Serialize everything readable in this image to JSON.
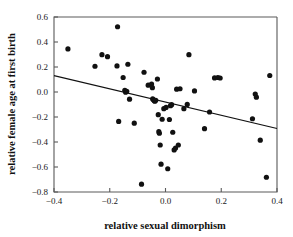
{
  "chart_data": {
    "type": "scatter",
    "title": "",
    "xlabel": "relative sexual dimorphism",
    "ylabel": "relative female age at first birth",
    "xlim": [
      -0.4,
      0.4
    ],
    "ylim": [
      -0.8,
      0.6
    ],
    "xticks": [
      -0.4,
      -0.2,
      0.0,
      0.2,
      0.4
    ],
    "xtick_labels": [
      "-0.4",
      "-0.2",
      "0.0",
      "0.2",
      "0.4"
    ],
    "yticks": [
      -0.8,
      -0.6,
      -0.4,
      -0.2,
      0.0,
      0.2,
      0.4,
      0.6
    ],
    "ytick_labels": [
      "-0.8",
      "-0.6",
      "-0.4",
      "-0.2",
      "0.0",
      "0.2",
      "0.4",
      "0.6"
    ],
    "grid": false,
    "legend": null,
    "marker": {
      "shape": "circle",
      "color": "#111111",
      "size_px": 5.2
    },
    "trendline": {
      "type": "linear",
      "color": "#111111",
      "x_start": -0.4,
      "y_start": 0.131,
      "x_end": 0.4,
      "y_end": -0.292,
      "slope": -0.529,
      "intercept": -0.0805
    },
    "points": [
      {
        "x": -0.35,
        "y": 0.345
      },
      {
        "x": -0.253,
        "y": 0.206
      },
      {
        "x": -0.228,
        "y": 0.299
      },
      {
        "x": -0.208,
        "y": 0.283
      },
      {
        "x": -0.172,
        "y": 0.522
      },
      {
        "x": -0.174,
        "y": 0.209
      },
      {
        "x": -0.168,
        "y": -0.235
      },
      {
        "x": -0.152,
        "y": 0.116
      },
      {
        "x": -0.146,
        "y": 0.014
      },
      {
        "x": -0.143,
        "y": -0.002
      },
      {
        "x": -0.139,
        "y": 0.006
      },
      {
        "x": -0.135,
        "y": 0.222
      },
      {
        "x": -0.129,
        "y": -0.057
      },
      {
        "x": -0.112,
        "y": -0.249
      },
      {
        "x": -0.086,
        "y": -0.737
      },
      {
        "x": -0.077,
        "y": 0.158
      },
      {
        "x": -0.062,
        "y": 0.055
      },
      {
        "x": -0.05,
        "y": 0.064
      },
      {
        "x": -0.047,
        "y": 0.035
      },
      {
        "x": -0.046,
        "y": -0.055
      },
      {
        "x": -0.043,
        "y": -0.062
      },
      {
        "x": -0.04,
        "y": -0.07
      },
      {
        "x": -0.038,
        "y": -0.074
      },
      {
        "x": -0.035,
        "y": -0.066
      },
      {
        "x": -0.029,
        "y": 0.104
      },
      {
        "x": -0.026,
        "y": -0.181
      },
      {
        "x": -0.024,
        "y": -0.317
      },
      {
        "x": -0.022,
        "y": -0.33
      },
      {
        "x": -0.019,
        "y": -0.424
      },
      {
        "x": -0.016,
        "y": -0.577
      },
      {
        "x": -0.012,
        "y": -0.218
      },
      {
        "x": -0.006,
        "y": -0.133
      },
      {
        "x": 0.002,
        "y": -0.123
      },
      {
        "x": 0.008,
        "y": -0.614
      },
      {
        "x": 0.014,
        "y": -0.22
      },
      {
        "x": 0.018,
        "y": -0.109
      },
      {
        "x": 0.022,
        "y": -0.101
      },
      {
        "x": 0.026,
        "y": -0.322
      },
      {
        "x": 0.031,
        "y": -0.463
      },
      {
        "x": 0.036,
        "y": -0.448
      },
      {
        "x": 0.04,
        "y": 0.023
      },
      {
        "x": 0.046,
        "y": -0.424
      },
      {
        "x": 0.052,
        "y": 0.026
      },
      {
        "x": 0.066,
        "y": -0.133
      },
      {
        "x": 0.078,
        "y": -0.099
      },
      {
        "x": 0.084,
        "y": 0.299
      },
      {
        "x": 0.104,
        "y": 0.009
      },
      {
        "x": 0.14,
        "y": -0.293
      },
      {
        "x": 0.158,
        "y": -0.16
      },
      {
        "x": 0.176,
        "y": 0.113
      },
      {
        "x": 0.188,
        "y": 0.116
      },
      {
        "x": 0.196,
        "y": 0.112
      },
      {
        "x": 0.312,
        "y": -0.214
      },
      {
        "x": 0.322,
        "y": -0.016
      },
      {
        "x": 0.326,
        "y": -0.041
      },
      {
        "x": 0.34,
        "y": -0.385
      },
      {
        "x": 0.362,
        "y": -0.682
      },
      {
        "x": 0.374,
        "y": 0.132
      }
    ]
  }
}
